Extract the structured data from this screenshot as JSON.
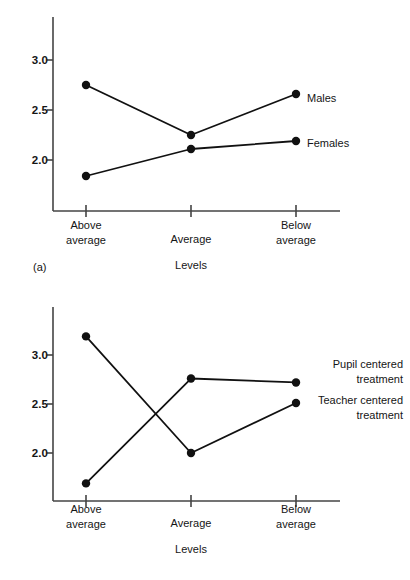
{
  "figure": {
    "panels": [
      {
        "tag": "(a)",
        "xlabel": "Levels",
        "xticks": [
          "Above\naverage",
          "Average",
          "Below\naverage"
        ],
        "yticks": [
          "3.0",
          "2.5",
          "2.0"
        ],
        "series_labels": [
          "Males",
          "Females"
        ]
      },
      {
        "tag": "(b)",
        "xlabel": "Levels",
        "xticks": [
          "Above\naverage",
          "Average",
          "Below\naverage"
        ],
        "yticks": [
          "3.0",
          "2.5",
          "2.0"
        ],
        "series_labels": [
          "Pupil centered\ntreatment",
          "Teacher centered\ntreatment"
        ]
      }
    ]
  },
  "chart_data": [
    {
      "type": "line",
      "title": "(a)",
      "xlabel": "Levels",
      "ylabel": "",
      "categories": [
        "Above average",
        "Average",
        "Below average"
      ],
      "ytick_values": [
        3.0,
        2.5,
        2.0
      ],
      "ylim": [
        1.55,
        3.25
      ],
      "grid": false,
      "legend_position": "right-of-plot-endpoints",
      "series": [
        {
          "name": "Males",
          "values": [
            2.75,
            2.25,
            2.66
          ]
        },
        {
          "name": "Females",
          "values": [
            1.84,
            2.11,
            2.19
          ]
        }
      ]
    },
    {
      "type": "line",
      "title": "(b)",
      "xlabel": "Levels",
      "ylabel": "",
      "categories": [
        "Above average",
        "Average",
        "Below average"
      ],
      "ytick_values": [
        3.0,
        2.5,
        2.0
      ],
      "ylim": [
        1.55,
        3.3
      ],
      "grid": false,
      "legend_position": "right-of-plot-endpoints",
      "series": [
        {
          "name": "Pupil centered treatment",
          "values": [
            1.69,
            2.76,
            2.72
          ]
        },
        {
          "name": "Teacher centered treatment",
          "values": [
            3.19,
            2.0,
            2.51
          ]
        }
      ]
    }
  ],
  "colors": {
    "line": "#111111",
    "marker": "#111111",
    "axis": "#444444",
    "text": "#151515",
    "background": "#ffffff"
  }
}
